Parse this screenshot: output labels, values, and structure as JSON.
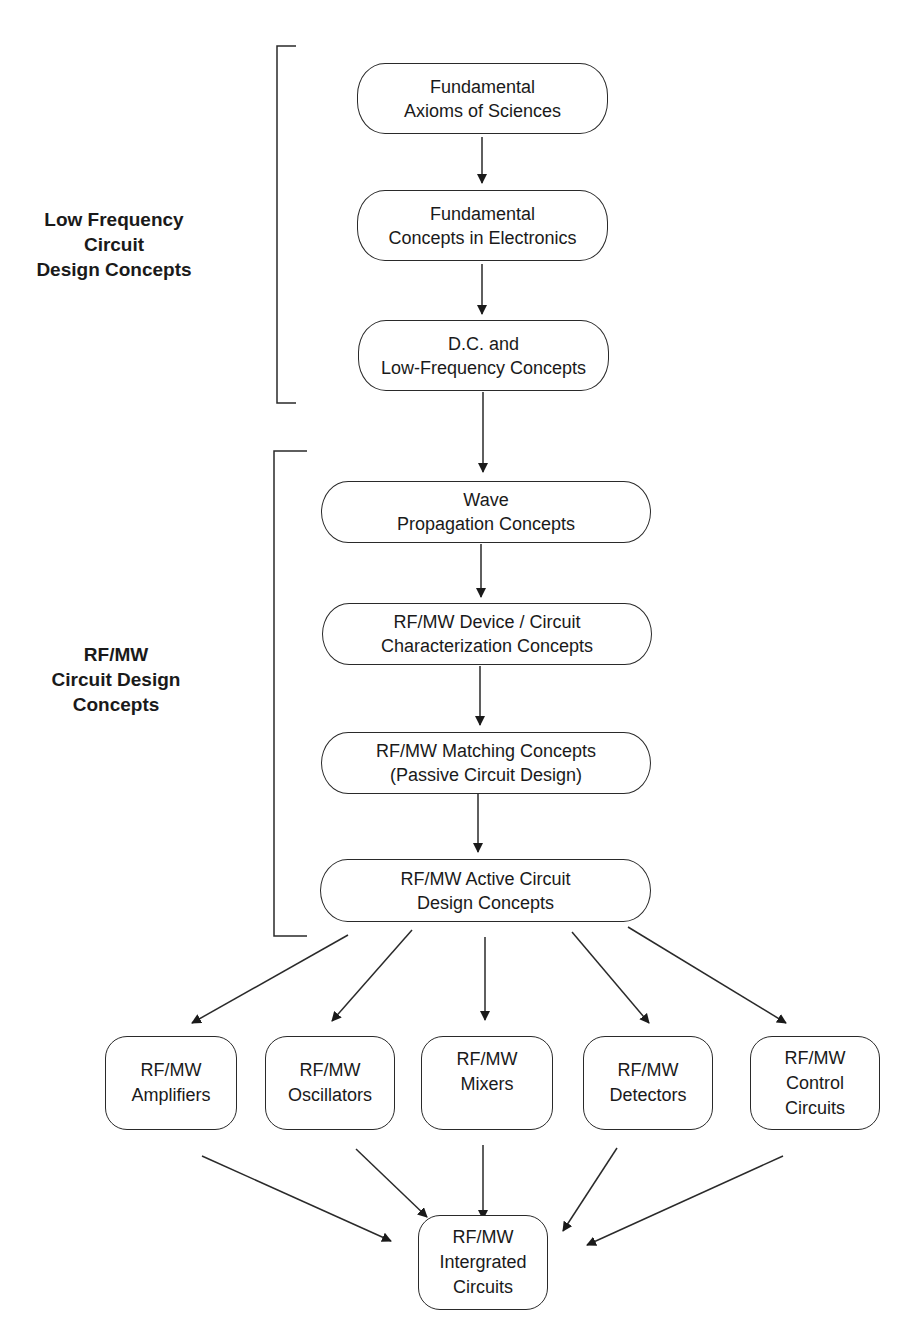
{
  "groups": [
    {
      "id": "low-frequency",
      "label_lines": [
        "Low Frequency",
        "Circuit",
        "Design Concepts"
      ]
    },
    {
      "id": "rfmw",
      "label_lines": [
        "RF/MW",
        "Circuit Design",
        "Concepts"
      ]
    }
  ],
  "nodes": {
    "axioms": [
      "Fundamental",
      "Axioms of Sciences"
    ],
    "electronics": [
      "Fundamental",
      "Concepts in Electronics"
    ],
    "dc": [
      "D.C. and",
      "Low-Frequency Concepts"
    ],
    "wave": [
      "Wave",
      "Propagation Concepts"
    ],
    "characterization": [
      "RF/MW Device / Circuit",
      "Characterization Concepts"
    ],
    "matching": [
      "RF/MW Matching Concepts",
      "(Passive Circuit Design)"
    ],
    "active": [
      "RF/MW Active Circuit",
      "Design Concepts"
    ],
    "amplifiers": [
      "RF/MW",
      "Amplifiers"
    ],
    "oscillators": [
      "RF/MW",
      "Oscillators"
    ],
    "mixers": [
      "RF/MW",
      "Mixers"
    ],
    "detectors": [
      "RF/MW",
      "Detectors"
    ],
    "control": [
      "RF/MW",
      "Control",
      "Circuits"
    ],
    "integrated": [
      "RF/MW",
      "Intergrated",
      "Circuits"
    ]
  },
  "edges": [
    [
      "axioms",
      "electronics"
    ],
    [
      "electronics",
      "dc"
    ],
    [
      "dc",
      "wave"
    ],
    [
      "wave",
      "characterization"
    ],
    [
      "characterization",
      "matching"
    ],
    [
      "matching",
      "active"
    ],
    [
      "active",
      "amplifiers"
    ],
    [
      "active",
      "oscillators"
    ],
    [
      "active",
      "mixers"
    ],
    [
      "active",
      "detectors"
    ],
    [
      "active",
      "control"
    ],
    [
      "amplifiers",
      "integrated"
    ],
    [
      "oscillators",
      "integrated"
    ],
    [
      "mixers",
      "integrated"
    ],
    [
      "detectors",
      "integrated"
    ],
    [
      "control",
      "integrated"
    ]
  ]
}
